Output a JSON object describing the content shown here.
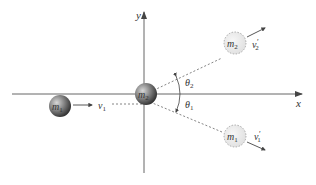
{
  "diagram": {
    "title": "",
    "axes": {
      "x_label": "x",
      "y_label": "y"
    },
    "particles": {
      "m1_initial": {
        "label": "m",
        "sub": "1"
      },
      "m2_initial": {
        "label": "m",
        "sub": "2"
      },
      "m2_final": {
        "label": "m",
        "sub": "2"
      },
      "m1_final": {
        "label": "m",
        "sub": "1"
      }
    },
    "velocities": {
      "v1": {
        "label": "v",
        "sub": "1",
        "prime": ""
      },
      "v2_prime": {
        "label": "v",
        "sub": "2",
        "prime": "′"
      },
      "v1_prime": {
        "label": "v",
        "sub": "1",
        "prime": "′"
      }
    },
    "angles": {
      "theta2": {
        "label": "θ",
        "sub": "2"
      },
      "theta1": {
        "label": "θ",
        "sub": "1"
      }
    },
    "colors": {
      "axis": "#555555",
      "sphere_dark": "#3a3a3a",
      "sphere_light": "#bdbdbd",
      "ghost_fill": "#eeeeee",
      "ghost_stroke": "#999999",
      "dashed": "#666666"
    }
  }
}
